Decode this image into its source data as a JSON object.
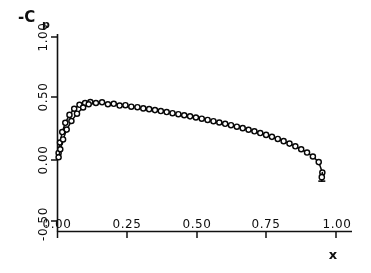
{
  "chart_data": {
    "type": "line",
    "title": "",
    "subtitle": "",
    "xlabel": "x",
    "ylabel": "-C",
    "ylabel_subscript": "p",
    "xlim": [
      0.0,
      1.0
    ],
    "ylim": [
      -0.5,
      1.0
    ],
    "grid": false,
    "legend": null,
    "xticks": [
      0.0,
      0.25,
      0.5,
      0.75,
      1.0
    ],
    "xticklabels": [
      "0.00",
      "0.25",
      "0.50",
      "0.75",
      "1.00"
    ],
    "yticks": [
      -0.5,
      0.0,
      0.5,
      1.0
    ],
    "yticklabels": [
      "-0.50",
      "0.00",
      "0.50",
      "1.00"
    ],
    "marker": "open-circle",
    "series": [
      {
        "name": "upper-branch",
        "x": [
          0.004,
          0.009,
          0.017,
          0.028,
          0.043,
          0.06,
          0.079,
          0.099,
          0.118,
          0.138,
          0.16,
          0.181,
          0.202,
          0.223,
          0.244,
          0.265,
          0.287,
          0.308,
          0.329,
          0.35,
          0.371,
          0.392,
          0.413,
          0.434,
          0.455,
          0.476,
          0.497,
          0.518,
          0.539,
          0.56,
          0.581,
          0.602,
          0.623,
          0.644,
          0.665,
          0.686,
          0.707,
          0.728,
          0.749,
          0.77,
          0.791,
          0.812,
          0.833,
          0.854,
          0.875,
          0.896,
          0.917,
          0.938,
          0.951
        ],
        "y": [
          0.055,
          0.14,
          0.225,
          0.3,
          0.365,
          0.415,
          0.447,
          0.462,
          0.47,
          0.462,
          0.468,
          0.452,
          0.455,
          0.441,
          0.444,
          0.432,
          0.428,
          0.418,
          0.412,
          0.404,
          0.396,
          0.388,
          0.379,
          0.371,
          0.362,
          0.353,
          0.344,
          0.334,
          0.324,
          0.314,
          0.303,
          0.292,
          0.281,
          0.269,
          0.257,
          0.244,
          0.231,
          0.217,
          0.202,
          0.186,
          0.169,
          0.151,
          0.131,
          0.109,
          0.085,
          0.058,
          0.026,
          -0.02,
          -0.105
        ]
      },
      {
        "name": "lower-branch",
        "x": [
          0.004,
          0.01,
          0.02,
          0.033,
          0.05,
          0.07,
          0.092,
          0.112
        ],
        "y": [
          0.02,
          0.085,
          0.165,
          0.245,
          0.315,
          0.375,
          0.425,
          0.452
        ]
      },
      {
        "name": "trailing-edge-hook",
        "x": [
          0.951,
          0.949
        ],
        "y": [
          -0.105,
          -0.175
        ]
      }
    ]
  },
  "axes": {
    "ylabel_text": "-C",
    "ylabel_sub": "p",
    "xlabel_text": "x"
  }
}
